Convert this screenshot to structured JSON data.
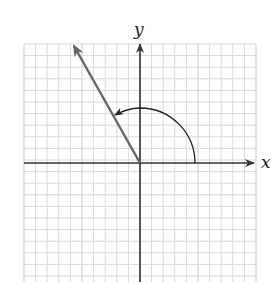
{
  "diagram": {
    "title": "",
    "axes": {
      "x_label": "x",
      "y_label": "y"
    },
    "grid": {
      "cells": 20,
      "cell_px": 11.6
    },
    "angle": {
      "terminal_side_deg": 120,
      "arc_radius_units": 4.75,
      "direction": "counterclockwise"
    },
    "colors": {
      "grid": "#d9d9d9",
      "axes": "#333333",
      "terminal_side": "#666666",
      "arc": "#222222"
    }
  }
}
